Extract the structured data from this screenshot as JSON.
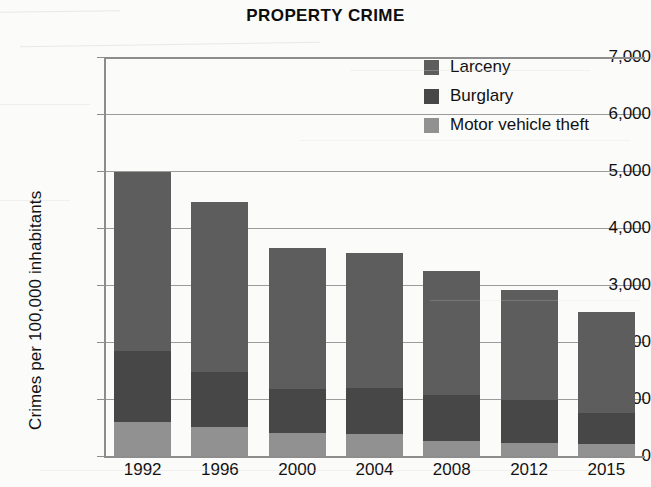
{
  "chart_data": {
    "type": "bar",
    "subtype": "stacked-vertical",
    "title": "PROPERTY CRIME",
    "xlabel": "",
    "ylabel": "Crimes per 100,000 inhabitants",
    "categories": [
      "1992",
      "1996",
      "2000",
      "2004",
      "2008",
      "2012",
      "2015"
    ],
    "ylim": [
      0,
      7000
    ],
    "yticks": [
      0,
      1000,
      2000,
      3000,
      4000,
      5000,
      6000,
      7000
    ],
    "ytick_labels": [
      "0",
      "1,000",
      "2,000",
      "3,000",
      "4,000",
      "5,000",
      "6,000",
      "7,000"
    ],
    "grid": true,
    "grid_axis": "y",
    "legend_position": "top-right",
    "stack_order_bottom_to_top": [
      "Motor vehicle theft",
      "Burglary",
      "Larceny"
    ],
    "series": [
      {
        "name": "Larceny",
        "color": "#5d5d5d",
        "values": [
          3130,
          2990,
          2480,
          2370,
          2175,
          1935,
          1775
        ]
      },
      {
        "name": "Burglary",
        "color": "#474747",
        "values": [
          1245,
          965,
          770,
          810,
          810,
          755,
          545
        ]
      },
      {
        "name": "Motor vehicle theft",
        "color": "#919191",
        "values": [
          600,
          510,
          405,
          385,
          265,
          230,
          210
        ]
      }
    ],
    "totals": [
      4975,
      4465,
      3655,
      3565,
      3250,
      2920,
      2530
    ]
  },
  "legend": {
    "items": [
      {
        "label": "Larceny",
        "color": "#5d5d5d",
        "swatch_name": "legend-swatch-larceny"
      },
      {
        "label": "Burglary",
        "color": "#474747",
        "swatch_name": "legend-swatch-burglary"
      },
      {
        "label": "Motor vehicle theft",
        "color": "#919191",
        "swatch_name": "legend-swatch-motor-vehicle-theft"
      }
    ]
  },
  "axes": {
    "y_axis_title": "Crimes per 100,000 inhabitants",
    "axis_color": "#8d8d8d",
    "grid_color": "#9b9b9b"
  }
}
